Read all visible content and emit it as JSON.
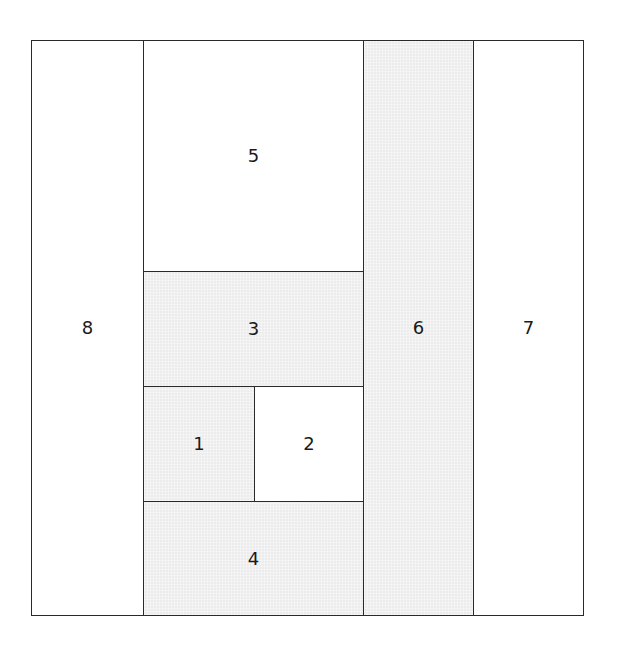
{
  "diagram": {
    "title": "",
    "type": "rectangle partition",
    "colors": {
      "shaded": "#ececec",
      "unshaded": "#ffffff",
      "border": "#2a2a2a"
    },
    "regions": [
      {
        "id": "8",
        "label": "8",
        "fill": "unshaded",
        "x": 0,
        "y": 0,
        "w": 113,
        "h": 576
      },
      {
        "id": "5",
        "label": "5",
        "fill": "unshaded",
        "x": 112,
        "y": 0,
        "w": 221,
        "h": 232
      },
      {
        "id": "3",
        "label": "3",
        "fill": "shaded",
        "x": 112,
        "y": 231,
        "w": 221,
        "h": 116
      },
      {
        "id": "1",
        "label": "1",
        "fill": "shaded",
        "x": 112,
        "y": 346,
        "w": 112,
        "h": 116
      },
      {
        "id": "2",
        "label": "2",
        "fill": "unshaded",
        "x": 223,
        "y": 346,
        "w": 110,
        "h": 116
      },
      {
        "id": "4",
        "label": "4",
        "fill": "shaded",
        "x": 112,
        "y": 461,
        "w": 221,
        "h": 115
      },
      {
        "id": "6",
        "label": "6",
        "fill": "shaded",
        "x": 332,
        "y": 0,
        "w": 111,
        "h": 576
      },
      {
        "id": "7",
        "label": "7",
        "fill": "unshaded",
        "x": 442,
        "y": 0,
        "w": 111,
        "h": 576
      }
    ]
  }
}
